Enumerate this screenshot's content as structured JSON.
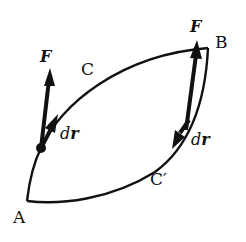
{
  "diagram": {
    "colors": {
      "stroke": "#111111",
      "background": "#ffffff"
    },
    "points": {
      "A": {
        "label": "A"
      },
      "B": {
        "label": "B"
      }
    },
    "paths": {
      "upper": {
        "label": "C"
      },
      "lower": {
        "label": "C′"
      }
    },
    "vectors": {
      "force_left": {
        "label": "F"
      },
      "force_right": {
        "label": "F"
      },
      "disp_left": {
        "d": "d",
        "r": "r"
      },
      "disp_right": {
        "d": "d",
        "r": "r"
      }
    }
  }
}
